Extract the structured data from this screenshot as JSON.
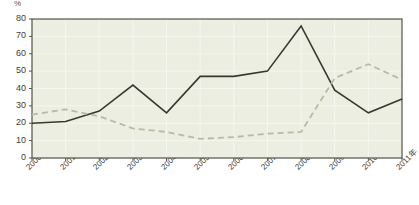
{
  "chart_data": {
    "type": "line",
    "title": "",
    "subtitle": "",
    "xlabel": "",
    "ylabel": "",
    "unit_label": "%",
    "categories": [
      "2000年",
      "2001年",
      "2002年",
      "2003年",
      "2004年",
      "2005年",
      "2006年",
      "2007年",
      "2008年",
      "2009年",
      "2010年",
      "2011年"
    ],
    "ylim": [
      0,
      80
    ],
    "yticks": [
      0,
      10,
      20,
      30,
      40,
      50,
      60,
      70,
      80
    ],
    "ytick_labels": [
      "0",
      "10",
      "20",
      "30",
      "40",
      "50",
      "60",
      "70",
      "80"
    ],
    "grid": true,
    "legend_position": "none",
    "series": [
      {
        "name": "solid-series",
        "style": "solid",
        "color": "#3a382f",
        "values": [
          20,
          21,
          27,
          42,
          26,
          47,
          47,
          50,
          76,
          39,
          26,
          34
        ]
      },
      {
        "name": "dashed-series",
        "style": "dashed",
        "color": "#b5bba6",
        "values": [
          25,
          28,
          24,
          17,
          15,
          11,
          12,
          14,
          15,
          46,
          54,
          45
        ]
      }
    ],
    "colors": {
      "plot_background": "#eceee1",
      "page_background": "#ffffff",
      "axis": "#55524a",
      "grid": "#f5f6ee",
      "tick_text": "#3f3c36"
    }
  }
}
